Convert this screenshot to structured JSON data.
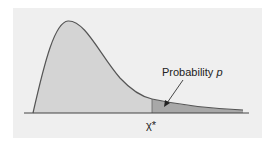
{
  "figure": {
    "type": "chi-square density with shaded upper tail",
    "annotation_text": "Probability",
    "annotation_var": "p",
    "critical_value_label": "χ*",
    "colors": {
      "panel_bg": "#efefef",
      "body_fill": "#d4d4d4",
      "tail_fill": "#a8a8a8",
      "curve": "#555555"
    }
  }
}
